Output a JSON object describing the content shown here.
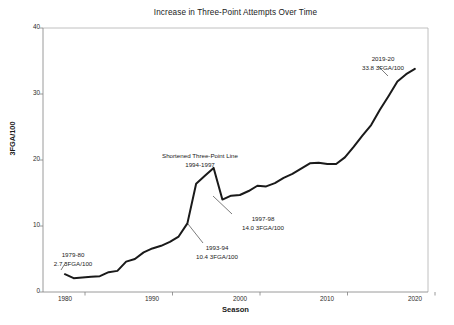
{
  "chart_data": {
    "type": "line",
    "title": "Increase in Three-Point Attempts Over Time",
    "xlabel": "Season",
    "ylabel": "3FGA/100",
    "xlim": [
      1977.5,
      2021.5
    ],
    "ylim": [
      0,
      40
    ],
    "xticks": [
      1980,
      1990,
      2000,
      2010,
      2020
    ],
    "xtick_labels": [
      "1980",
      "1990",
      "2000",
      "2010",
      "2020"
    ],
    "yticks": [
      0,
      10,
      20,
      30,
      40
    ],
    "ytick_labels": [
      "0",
      "10",
      "20",
      "30",
      "40"
    ],
    "grid": false,
    "legend": "none",
    "line_color": "#1a1a1a",
    "line_width": 2.0,
    "x": [
      1980,
      1981,
      1982,
      1983,
      1984,
      1985,
      1986,
      1987,
      1988,
      1989,
      1990,
      1991,
      1992,
      1993,
      1994,
      1995,
      1996,
      1997,
      1998,
      1999,
      2000,
      2001,
      2002,
      2003,
      2004,
      2005,
      2006,
      2007,
      2008,
      2009,
      2010,
      2011,
      2012,
      2013,
      2014,
      2015,
      2016,
      2017,
      2018,
      2019,
      2020
    ],
    "values": [
      2.7,
      2.1,
      2.2,
      2.3,
      2.4,
      3.0,
      3.2,
      4.6,
      5.0,
      6.0,
      6.6,
      7.0,
      7.6,
      8.4,
      10.4,
      16.4,
      17.6,
      18.8,
      14.0,
      14.6,
      14.7,
      15.3,
      16.1,
      16.0,
      16.5,
      17.3,
      17.9,
      18.7,
      19.5,
      19.6,
      19.4,
      19.4,
      20.4,
      22.0,
      23.7,
      25.3,
      27.6,
      29.7,
      31.9,
      33.0,
      33.8
    ],
    "annotations": [
      {
        "id": "first-season",
        "lines": [
          "1979-80",
          "2.7 3FGA/100"
        ],
        "season": "1979-80",
        "value": "2.7 3FGA/100"
      },
      {
        "id": "pre-shortened-line",
        "lines": [
          "1993-94",
          "10.4 3FGA/100"
        ],
        "season": "1993-94",
        "value": "10.4 3FGA/100"
      },
      {
        "id": "shortened-line-period",
        "lines": [
          "Shortened Three-Point Line",
          "1994-1997"
        ],
        "season": "1994-1997",
        "value": "Shortened Three-Point Line"
      },
      {
        "id": "post-shortened-line",
        "lines": [
          "1997-98",
          "14.0 3FGA/100"
        ],
        "season": "1997-98",
        "value": "14.0 3FGA/100"
      },
      {
        "id": "latest-season",
        "lines": [
          "2019-20",
          "33.8 3FGA/100"
        ],
        "season": "2019-20",
        "value": "33.8 3FGA/100"
      }
    ]
  },
  "figure": {
    "title": "Increase in Three-Point Attempts Over Time",
    "x_axis_label": "Season",
    "y_axis_label": "3FGA/100",
    "background": "#ffffff",
    "axis_color": "#aaaaaa"
  },
  "annotations": {
    "a0_line1": "1979-80",
    "a0_line2": "2.7 3FGA/100",
    "a1_line1": "1993-94",
    "a1_line2": "10.4 3FGA/100",
    "a2_line1": "Shortened Three-Point Line",
    "a2_line2": "1994-1997",
    "a3_line1": "1997-98",
    "a3_line2": "14.0 3FGA/100",
    "a4_line1": "2019-20",
    "a4_line2": "33.8 3FGA/100"
  },
  "ticks": {
    "y": [
      "40",
      "30",
      "20",
      "10",
      "0"
    ],
    "x": [
      "1980",
      "1990",
      "2000",
      "2010",
      "2020"
    ]
  }
}
